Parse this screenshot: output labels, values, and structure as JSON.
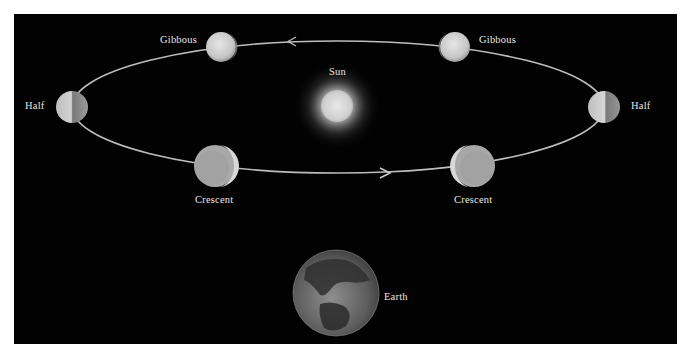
{
  "diagram": {
    "colors": {
      "background": "#020202",
      "page": "#ffffff",
      "orbit": "#bdbdbd",
      "label": "#e6e6e6"
    },
    "sun": {
      "label": "Sun"
    },
    "earth": {
      "label": "Earth"
    },
    "phases": [
      {
        "id": "gibbous-left",
        "label": "Gibbous"
      },
      {
        "id": "gibbous-right",
        "label": "Gibbous"
      },
      {
        "id": "half-left",
        "label": "Half"
      },
      {
        "id": "half-right",
        "label": "Half"
      },
      {
        "id": "crescent-left",
        "label": "Crescent"
      },
      {
        "id": "crescent-right",
        "label": "Crescent"
      }
    ],
    "arrows": [
      {
        "id": "arrow-top",
        "direction": "left"
      },
      {
        "id": "arrow-bottom",
        "direction": "right"
      }
    ]
  }
}
